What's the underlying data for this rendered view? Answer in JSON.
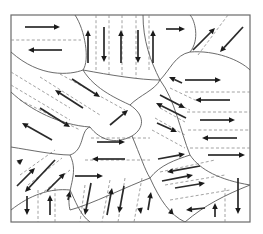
{
  "diagram": {
    "title": "",
    "frame": {
      "x": 11,
      "y": 15,
      "width": 239,
      "height": 207
    },
    "colors": {
      "boundary": "#5a5a5a",
      "dash": "#8a8a8a",
      "arrow": "#1a1a1a",
      "frame": "#6a6a6a"
    },
    "boundaries": [
      "M 11 52 C 40 78, 70 75, 83 70 C 90 60, 85 30, 75 15",
      "M 83 70 C 110 75, 140 80, 160 80 C 150 60, 143 40, 143 15",
      "M 160 80 C 170 70, 175 55, 190 52 C 200 40, 195 20, 190 15",
      "M 190 52 C 215 50, 240 60, 250 70",
      "M 160 80 C 175 100, 180 130, 190 155 C 200 170, 220 180, 250 185",
      "M 83 70 C 95 90, 120 100, 130 105",
      "M 11 92 C 30 110, 60 125, 90 127",
      "M 130 105 C 140 95, 155 90, 160 80",
      "M 90 127 C 100 140, 115 145, 132 136 C 145 128, 145 115, 130 105",
      "M 11 147 C 30 150, 55 155, 70 155",
      "M 70 155 C 85 150, 80 130, 90 127",
      "M 70 155 C 80 175, 65 190, 70 210 C 90 205, 130 185, 150 178",
      "M 132 136 C 140 155, 145 170, 150 178",
      "M 11 210 C 30 195, 50 188, 70 190",
      "M 70 190 C 75 200, 80 215, 90 222",
      "M 150 178 C 160 165, 175 160, 190 155",
      "M 150 178 C 160 200, 170 215, 185 222",
      "M 185 222 C 205 205, 225 195, 250 185"
    ],
    "dashed_lines": [
      "M 11 40 L 81 40",
      "M 96 15 L 96 72",
      "M 109 15 L 109 74",
      "M 122 15 L 122 76",
      "M 136 15 L 136 78",
      "M 149 15 L 149 70",
      "M 198 55 L 228 15",
      "M 11 72 L 70 108",
      "M 11 85 L 70 120",
      "M 40 77 L 100 115",
      "M 60 74 L 125 110",
      "M 20 100 L 80 130",
      "M 170 88 L 195 100",
      "M 165 98 L 190 110",
      "M 160 108 L 185 122",
      "M 155 118 L 185 135",
      "M 152 130 L 185 148",
      "M 185 92 L 250 92",
      "M 187 112 L 250 112",
      "M 188 130 L 250 130",
      "M 190 148 L 250 148",
      "M 91 138 L 150 138",
      "M 85 160 L 150 160",
      "M 20 175 L 55 150",
      "M 28 185 L 62 158",
      "M 40 195 L 70 170",
      "M 38 190 L 38 222",
      "M 55 188 L 55 222",
      "M 85 185 L 80 222",
      "M 110 180 L 102 222",
      "M 125 178 L 118 222",
      "M 142 178 L 134 222",
      "M 160 172 L 215 160",
      "M 165 185 L 225 175",
      "M 170 200 L 230 190",
      "M 225 188 L 225 222"
    ],
    "arrows": [
      {
        "x1": 25,
        "y1": 27,
        "x2": 60,
        "y2": 27
      },
      {
        "x1": 62,
        "y1": 50,
        "x2": 28,
        "y2": 50
      },
      {
        "x1": 88,
        "y1": 63,
        "x2": 88,
        "y2": 30
      },
      {
        "x1": 104,
        "y1": 27,
        "x2": 104,
        "y2": 62
      },
      {
        "x1": 121,
        "y1": 63,
        "x2": 121,
        "y2": 30
      },
      {
        "x1": 138,
        "y1": 30,
        "x2": 138,
        "y2": 63
      },
      {
        "x1": 153,
        "y1": 63,
        "x2": 153,
        "y2": 30
      },
      {
        "x1": 166,
        "y1": 29,
        "x2": 185,
        "y2": 29
      },
      {
        "x1": 193,
        "y1": 50,
        "x2": 215,
        "y2": 28
      },
      {
        "x1": 243,
        "y1": 27,
        "x2": 220,
        "y2": 52
      },
      {
        "x1": 185,
        "y1": 80,
        "x2": 221,
        "y2": 80
      },
      {
        "x1": 230,
        "y1": 100,
        "x2": 195,
        "y2": 100
      },
      {
        "x1": 200,
        "y1": 120,
        "x2": 235,
        "y2": 120
      },
      {
        "x1": 237,
        "y1": 138,
        "x2": 202,
        "y2": 138
      },
      {
        "x1": 208,
        "y1": 155,
        "x2": 245,
        "y2": 155
      },
      {
        "x1": 72,
        "y1": 79,
        "x2": 100,
        "y2": 97
      },
      {
        "x1": 83,
        "y1": 108,
        "x2": 55,
        "y2": 90
      },
      {
        "x1": 40,
        "y1": 108,
        "x2": 70,
        "y2": 127
      },
      {
        "x1": 52,
        "y1": 140,
        "x2": 22,
        "y2": 123
      },
      {
        "x1": 182,
        "y1": 83,
        "x2": 169,
        "y2": 77
      },
      {
        "x1": 160,
        "y1": 95,
        "x2": 185,
        "y2": 108
      },
      {
        "x1": 186,
        "y1": 118,
        "x2": 156,
        "y2": 103
      },
      {
        "x1": 157,
        "y1": 123,
        "x2": 177,
        "y2": 132
      },
      {
        "x1": 110,
        "y1": 125,
        "x2": 128,
        "y2": 110
      },
      {
        "x1": 97,
        "y1": 142,
        "x2": 125,
        "y2": 142
      },
      {
        "x1": 125,
        "y1": 159,
        "x2": 92,
        "y2": 159
      },
      {
        "x1": 75,
        "y1": 176,
        "x2": 103,
        "y2": 176
      },
      {
        "x1": 18,
        "y1": 163,
        "x2": 23,
        "y2": 159
      },
      {
        "x1": 17,
        "y1": 186,
        "x2": 35,
        "y2": 168
      },
      {
        "x1": 55,
        "y1": 160,
        "x2": 25,
        "y2": 192
      },
      {
        "x1": 47,
        "y1": 191,
        "x2": 65,
        "y2": 173
      },
      {
        "x1": 158,
        "y1": 159,
        "x2": 185,
        "y2": 154
      },
      {
        "x1": 162,
        "y1": 181,
        "x2": 193,
        "y2": 175
      },
      {
        "x1": 200,
        "y1": 166,
        "x2": 167,
        "y2": 172
      },
      {
        "x1": 175,
        "y1": 188,
        "x2": 205,
        "y2": 183
      },
      {
        "x1": 205,
        "y1": 208,
        "x2": 186,
        "y2": 210
      },
      {
        "x1": 27,
        "y1": 196,
        "x2": 27,
        "y2": 215
      },
      {
        "x1": 50,
        "y1": 215,
        "x2": 50,
        "y2": 195
      },
      {
        "x1": 68,
        "y1": 200,
        "x2": 70,
        "y2": 191
      },
      {
        "x1": 91,
        "y1": 183,
        "x2": 85,
        "y2": 215
      },
      {
        "x1": 107,
        "y1": 215,
        "x2": 112,
        "y2": 188
      },
      {
        "x1": 124,
        "y1": 186,
        "x2": 119,
        "y2": 213
      },
      {
        "x1": 140,
        "y1": 208,
        "x2": 141,
        "y2": 214
      },
      {
        "x1": 148,
        "y1": 210,
        "x2": 151,
        "y2": 192
      },
      {
        "x1": 171,
        "y1": 213,
        "x2": 172,
        "y2": 208
      },
      {
        "x1": 215,
        "y1": 217,
        "x2": 215,
        "y2": 203
      },
      {
        "x1": 238,
        "y1": 178,
        "x2": 238,
        "y2": 214
      }
    ]
  }
}
